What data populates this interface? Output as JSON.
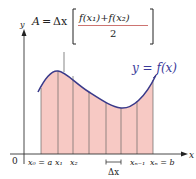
{
  "formula": {
    "lhs": "A",
    "eq": "=",
    "delta_x": "Δx",
    "numerator": "f(x₁)+f(x₂)",
    "denominator": "2"
  },
  "curve_label": "y = f(x)",
  "axes": {
    "x_label": "x",
    "y_label": "y",
    "origin": "0"
  },
  "tick_labels": [
    "x₀ = a",
    "x₁",
    "x₂",
    "xₙ₋₁",
    "xₙ = b"
  ],
  "delta_label": "Δx",
  "colors": {
    "fill": "#f7c9c4",
    "curve": "#3a3a8a",
    "lines": "#555555",
    "fraction_bar": "#c0504d"
  }
}
